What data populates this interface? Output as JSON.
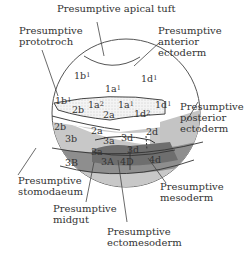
{
  "colors": {
    "outline": "#555555",
    "animal_white": "#ffffff",
    "prototroch_stipple": "#e8e8e8",
    "stomodaeum_light_gray": "#c8c8c8",
    "posterior_ectoderm_gray": "#c4c4c4",
    "mesoderm_dark_gray": "#8a8a8a",
    "midgut_darkest": "#6e6e6e"
  },
  "labels": {
    "apical_tuft": "Presumptive apical tuft",
    "prototroch_1": "Presumptive",
    "prototroch_2": "prototroch",
    "anterior_ectoderm_1": "Presumptive",
    "anterior_ectoderm_2": "anterior",
    "anterior_ectoderm_3": "ectoderm",
    "posterior_ectoderm_1": "Presumptive",
    "posterior_ectoderm_2": "posterior",
    "posterior_ectoderm_3": "ectoderm",
    "stomodaeum_1": "Presumptive",
    "stomodaeum_2": "stomodaeum",
    "mesoderm_1": "Presumptive",
    "mesoderm_2": "mesoderm",
    "midgut_1": "Presumptive",
    "midgut_2": "midgut",
    "ectomesoderm_1": "Presumptive",
    "ectomesoderm_2": "ectomesoderm"
  },
  "cells": [
    {
      "id": "1b1_top",
      "base": "1b",
      "sup": "1"
    },
    {
      "id": "1a1_top",
      "base": "1a",
      "sup": "1"
    },
    {
      "id": "1d1_top",
      "base": "1d",
      "sup": "1"
    },
    {
      "id": "1b1_band",
      "base": "1b",
      "sup": "1"
    },
    {
      "id": "1a2",
      "base": "1a",
      "sup": "2"
    },
    {
      "id": "1a1_band",
      "base": "1a",
      "sup": "1"
    },
    {
      "id": "1d2",
      "base": "1d",
      "sup": "2"
    },
    {
      "id": "1d1_right",
      "base": "1d",
      "sup": "1"
    },
    {
      "id": "2b_band",
      "base": "2b",
      "sup": ""
    },
    {
      "id": "2a_band",
      "base": "2a",
      "sup": ""
    },
    {
      "id": "2b",
      "base": "2b",
      "sup": ""
    },
    {
      "id": "2a",
      "base": "2a",
      "sup": ""
    },
    {
      "id": "3b",
      "base": "3b",
      "sup": ""
    },
    {
      "id": "3a_upper",
      "base": "3a",
      "sup": ""
    },
    {
      "id": "3d_upper",
      "base": "3d",
      "sup": ""
    },
    {
      "id": "2d",
      "base": "2d",
      "sup": ""
    },
    {
      "id": "3a",
      "base": "3a",
      "sup": ""
    },
    {
      "id": "3d",
      "base": "3d",
      "sup": ""
    },
    {
      "id": "3B",
      "base": "3B",
      "sup": ""
    },
    {
      "id": "3A",
      "base": "3A",
      "sup": ""
    },
    {
      "id": "4D",
      "base": "4D",
      "sup": ""
    },
    {
      "id": "4d",
      "base": "4d",
      "sup": ""
    }
  ]
}
